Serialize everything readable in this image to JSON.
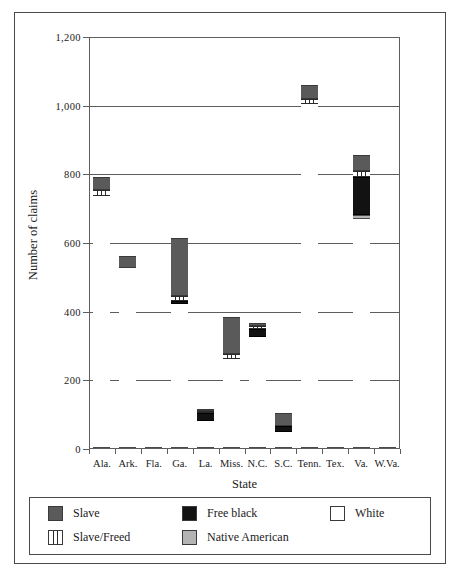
{
  "chart_data": {
    "type": "bar",
    "title": "",
    "subtitle": "",
    "xlabel": "State",
    "ylabel": "Number of claims",
    "ylim": [
      0,
      1200
    ],
    "yticks": [
      0,
      200,
      400,
      600,
      800,
      1000,
      1200
    ],
    "ytick_labels": [
      "0",
      "200",
      "400",
      "600",
      "800",
      "1,000",
      "1,200"
    ],
    "grid": true,
    "stacked": true,
    "legend_position": "bottom",
    "categories": [
      "Ala.",
      "Ark.",
      "Fla.",
      "Ga.",
      "La.",
      "Miss.",
      "N.C.",
      "S.C.",
      "Tenn.",
      "Tex.",
      "Va.",
      "W.Va."
    ],
    "series": [
      {
        "name": "White",
        "color": "#ffffff",
        "values": [
          730,
          520,
          35,
          418,
          75,
          255,
          320,
          45,
          1000,
          18,
          665,
          42
        ]
      },
      {
        "name": "Native American",
        "color": "#b4b4b4",
        "values": [
          0,
          0,
          0,
          0,
          0,
          0,
          0,
          0,
          0,
          0,
          10,
          0
        ]
      },
      {
        "name": "Free black",
        "color": "#121212",
        "values": [
          0,
          0,
          0,
          7,
          25,
          0,
          25,
          15,
          0,
          0,
          110,
          0
        ]
      },
      {
        "name": "Slave/Freed",
        "color": "hatched",
        "values": [
          20,
          0,
          0,
          15,
          5,
          15,
          7,
          0,
          15,
          0,
          20,
          0
        ]
      },
      {
        "name": "Slave",
        "color": "#5a5a5a",
        "values": [
          35,
          35,
          0,
          170,
          5,
          110,
          8,
          40,
          40,
          0,
          45,
          0
        ]
      }
    ],
    "totals": [
      785,
      555,
      35,
      610,
      110,
      380,
      360,
      100,
      1055,
      18,
      850,
      42
    ]
  },
  "legend": {
    "items": [
      {
        "label": "Slave",
        "swatch": "slave-swatch"
      },
      {
        "label": "Free black",
        "swatch": "free-black-swatch"
      },
      {
        "label": "White",
        "swatch": "white-swatch"
      },
      {
        "label": "Slave/Freed",
        "swatch": "slave-freed-swatch"
      },
      {
        "label": "Native American",
        "swatch": "native-american-swatch"
      }
    ]
  }
}
